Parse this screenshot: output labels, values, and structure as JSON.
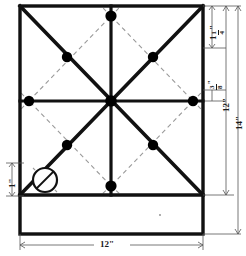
{
  "figure": {
    "type": "technical-drawing",
    "units": "inches",
    "stroke_color": "#111111",
    "dashed_color": "#9a9a9a",
    "dot_color": "#000000",
    "background": "#ffffff"
  },
  "dimensions": {
    "top_segment": {
      "whole": "1",
      "numerator": "1",
      "denominator": "4",
      "suffix": "\"",
      "plain": "1 1/4\""
    },
    "small_segment": {
      "numerator": "3",
      "denominator": "8",
      "suffix": "\"",
      "plain": "3/8\""
    },
    "inner_height": {
      "value": "12",
      "suffix": "\"",
      "plain": "12\""
    },
    "overall_height": {
      "value": "14",
      "suffix": "\"",
      "plain": "14\""
    },
    "overall_width": {
      "value": "12",
      "suffix": "\"",
      "plain": "12\""
    },
    "hole_offset": {
      "value": "1",
      "suffix": "\"",
      "plain": "1\""
    }
  },
  "geometry": {
    "outer_rect": {
      "x": 20,
      "y": 6,
      "w": 183,
      "h": 228
    },
    "inner_square": {
      "x": 20,
      "y": 6,
      "w": 183,
      "h": 189
    },
    "center": {
      "x": 111,
      "y": 101
    },
    "solid_lines": [
      {
        "name": "vertical-center-line",
        "x1": 111,
        "y1": 6,
        "x2": 111,
        "y2": 195
      },
      {
        "name": "horizontal-center-line",
        "x1": 20,
        "y1": 101,
        "x2": 203,
        "y2": 101
      },
      {
        "name": "diagonal-tl-br",
        "x1": 20,
        "y1": 6,
        "x2": 203,
        "y2": 195
      },
      {
        "name": "diagonal-tr-bl",
        "x1": 203,
        "y1": 6,
        "x2": 20,
        "y2": 195
      }
    ],
    "dashed_diamond": [
      {
        "x": 111,
        "y": 16
      },
      {
        "x": 193,
        "y": 101
      },
      {
        "x": 111,
        "y": 186
      },
      {
        "x": 29,
        "y": 101
      }
    ],
    "dots": [
      {
        "name": "dot-top-center",
        "x": 111,
        "y": 16,
        "r": 5.5
      },
      {
        "name": "dot-upper-left",
        "x": 67,
        "y": 57,
        "r": 5
      },
      {
        "name": "dot-upper-right",
        "x": 153,
        "y": 57,
        "r": 5
      },
      {
        "name": "dot-mid-left",
        "x": 29,
        "y": 101,
        "r": 5
      },
      {
        "name": "dot-center",
        "x": 111,
        "y": 101,
        "r": 5.5
      },
      {
        "name": "dot-mid-right",
        "x": 193,
        "y": 101,
        "r": 5
      },
      {
        "name": "dot-lower-left",
        "x": 67,
        "y": 145,
        "r": 5
      },
      {
        "name": "dot-lower-right",
        "x": 153,
        "y": 145,
        "r": 5
      },
      {
        "name": "dot-bottom-center",
        "x": 111,
        "y": 186,
        "r": 5.5
      }
    ],
    "hole_marker": {
      "name": "hole-circle",
      "x": 45,
      "y": 180,
      "r": 12
    },
    "speck": {
      "x": 160,
      "y": 215,
      "r": 1
    }
  }
}
